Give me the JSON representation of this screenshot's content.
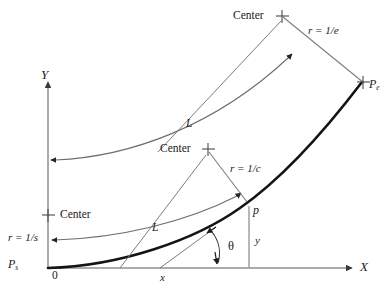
{
  "figure": {
    "colors": {
      "axis": "#8c8c8c",
      "curve_thick": "#1a1a1a",
      "curve_thin": "#6e6e6e",
      "radius_line": "#7a7a7a",
      "text": "#1a1a1a",
      "dropline": "#9a9a9a",
      "background": "#ffffff"
    },
    "axes": {
      "x_label": "X",
      "y_label": "Y",
      "origin_label": "0"
    },
    "points": {
      "start": {
        "label": "P",
        "sub": "s"
      },
      "end": {
        "label": "P",
        "sub": "e"
      },
      "current": {
        "label": "p"
      }
    },
    "centers": [
      {
        "id": "center-start",
        "label": "Center",
        "radius_label_prefix": "r = 1/",
        "radius_label_param": "s",
        "radius_label": "r = 1/s"
      },
      {
        "id": "center-mid",
        "label": "Center",
        "radius_label_prefix": "r = 1/",
        "radius_label_param": "c",
        "radius_label": "r = 1/c"
      },
      {
        "id": "center-end",
        "label": "Center",
        "radius_label_prefix": "r = 1/",
        "radius_label_param": "e",
        "radius_label": "r = 1/e"
      }
    ],
    "arc_labels": [
      {
        "id": "arc-length-lower",
        "label": "L"
      },
      {
        "id": "arc-length-upper",
        "label": "L"
      }
    ],
    "coordinate_labels": {
      "x": "x",
      "y": "y",
      "theta": "θ"
    }
  }
}
